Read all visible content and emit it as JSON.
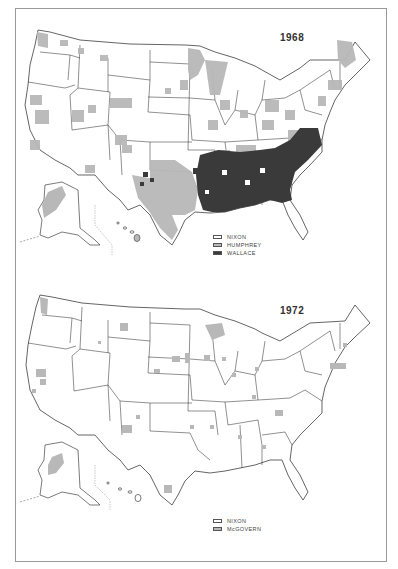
{
  "maps": [
    {
      "year": "1968",
      "legend": [
        {
          "label": "NIXON",
          "color": "#ffffff"
        },
        {
          "label": "HUMPHREY",
          "color": "#b8b8b8"
        },
        {
          "label": "WALLACE",
          "color": "#3a3a3a"
        }
      ]
    },
    {
      "year": "1972",
      "legend": [
        {
          "label": "NIXON",
          "color": "#ffffff"
        },
        {
          "label": "McGOVERN",
          "color": "#b8b8b8"
        }
      ]
    }
  ],
  "colors": {
    "outline": "#222222",
    "humphrey_mcgovern": "#b8b8b8",
    "wallace": "#3a3a3a",
    "frame": "#9a9a9a"
  }
}
